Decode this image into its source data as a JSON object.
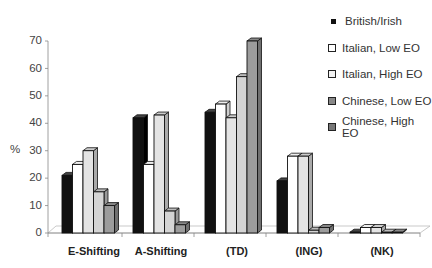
{
  "chart_data": {
    "type": "bar",
    "title": "",
    "xlabel": "",
    "ylabel": "%",
    "ylim": [
      0,
      70
    ],
    "yticks": [
      0,
      10,
      20,
      30,
      40,
      50,
      60,
      70
    ],
    "categories": [
      "E-Shifting",
      "A-Shifting",
      "(TD)",
      "(ING)",
      "(NK)"
    ],
    "series": [
      {
        "name": "British/Irish",
        "color": "#111111",
        "values": [
          21,
          42,
          44,
          19,
          0
        ]
      },
      {
        "name": "Italian, Low EO",
        "color": "#ffffff",
        "values": [
          25,
          25,
          47,
          28,
          2
        ]
      },
      {
        "name": "Italian, High EO",
        "color": "#dedede",
        "values": [
          30,
          43,
          42,
          28,
          2
        ]
      },
      {
        "name": "Chinese, Low EO",
        "color": "#cfcfcf",
        "values": [
          15,
          8,
          57,
          1,
          0
        ]
      },
      {
        "name": "Chinese, High EO",
        "color": "#9a9a9a",
        "values": [
          10,
          3,
          70,
          2,
          0
        ]
      }
    ],
    "legend_position": "right",
    "grid": false,
    "style": "3d-bar"
  },
  "legend": {
    "items": [
      "British/Irish",
      "Italian, Low EO",
      "Italian, High EO",
      "Chinese, Low EO",
      "Chinese, High EO"
    ]
  },
  "axis": {
    "ylabel": "%",
    "ticks": [
      "0",
      "10",
      "20",
      "30",
      "40",
      "50",
      "60",
      "70"
    ],
    "categories": [
      "E-Shifting",
      "A-Shifting",
      "(TD)",
      "(ING)",
      "(NK)"
    ]
  }
}
